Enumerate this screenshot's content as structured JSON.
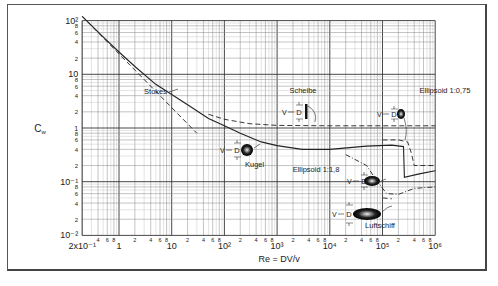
{
  "chart_data": {
    "type": "line",
    "title": "",
    "xlabel": "Re = DV/ν",
    "ylabel": "Cw",
    "xscale": "log",
    "yscale": "log",
    "xlim": [
      0.2,
      1000000
    ],
    "ylim": [
      0.01,
      100
    ],
    "grid": true,
    "x_tick_labels": [
      "2x10⁻¹",
      "1",
      "10",
      "10²",
      "10³",
      "10⁴",
      "10⁵",
      "10⁶"
    ],
    "x_minor_labels": [
      "2",
      "4",
      "6",
      "8"
    ],
    "y_tick_labels": [
      "10²",
      "10",
      "1",
      "10⁻¹",
      "10⁻²"
    ],
    "y_minor_labels": [
      "8",
      "6",
      "4",
      "2"
    ],
    "series": [
      {
        "name": "Kugel",
        "style": "solid",
        "x": [
          0.2,
          0.5,
          1,
          2,
          5,
          10,
          20,
          50,
          100,
          200,
          500,
          1000,
          3000,
          10000,
          50000,
          150000,
          250000,
          260000,
          500000,
          1000000
        ],
        "y": [
          120,
          50,
          26,
          14,
          6.5,
          4.2,
          2.7,
          1.5,
          1.1,
          0.8,
          0.55,
          0.47,
          0.4,
          0.4,
          0.46,
          0.48,
          0.45,
          0.12,
          0.14,
          0.16
        ]
      },
      {
        "name": "Stokes",
        "style": "dashed",
        "x": [
          0.2,
          1,
          5,
          10,
          30
        ],
        "y": [
          120,
          24,
          4.8,
          2.4,
          0.8
        ]
      },
      {
        "name": "Scheibe",
        "style": "dashed",
        "x": [
          50,
          100,
          300,
          1000,
          10000,
          100000,
          1000000
        ],
        "y": [
          1.8,
          1.45,
          1.2,
          1.12,
          1.1,
          1.1,
          1.1
        ]
      },
      {
        "name": "Ellipsoid 1:0,75",
        "style": "dashed",
        "x": [
          100000,
          200000,
          300000,
          350000,
          400000,
          1000000
        ],
        "y": [
          0.6,
          0.6,
          0.55,
          0.35,
          0.2,
          0.2
        ]
      },
      {
        "name": "Ellipsoid 1:1,8",
        "style": "dash-dot",
        "x": [
          20000,
          50000,
          80000,
          120000,
          200000,
          400000,
          1000000
        ],
        "y": [
          0.32,
          0.2,
          0.1,
          0.06,
          0.058,
          0.075,
          0.08
        ]
      },
      {
        "name": "Luftschiff",
        "style": "dashed",
        "x": [
          100000,
          150000
        ],
        "y": [
          0.05,
          0.048
        ]
      }
    ],
    "annotations": [
      "Stokes",
      "Scheibe",
      "Kugel",
      "Ellipsoid 1:0,75",
      "Ellipsoid 1:1,8",
      "Luftschiff",
      "V",
      "D"
    ]
  },
  "labels": {
    "ylabel": "C",
    "ylabel_sub": "w",
    "xlabel": "Re = DV/v",
    "stokes": "Stokes",
    "scheibe": "Scheibe",
    "kugel": "Kugel",
    "ell075": "Ellipsoid 1:0,75",
    "ell18": "Ellipsoid 1:1,8",
    "luftschiff": "Luftschiff",
    "v": "V",
    "d": "D"
  }
}
